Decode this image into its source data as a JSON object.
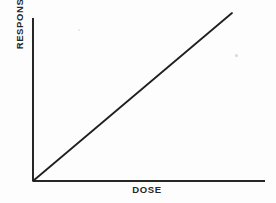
{
  "figure": {
    "background_color": "#fdfdfd",
    "ink_color": "#262626",
    "x_axis_label": "DOSE",
    "y_axis_label": "RESPONSE"
  },
  "chart_data": {
    "type": "line",
    "title": "",
    "subtitle": "",
    "xlabel": "DOSE",
    "ylabel": "RESPONSE",
    "grid": false,
    "legend": false,
    "axis_ticks": false,
    "tick_labels": {
      "x": [],
      "y": []
    },
    "xlim": [
      0,
      1
    ],
    "ylim": [
      0,
      1
    ],
    "series": [
      {
        "name": "dose-response",
        "style": "straight-line",
        "x": [
          0,
          1
        ],
        "y": [
          0,
          1
        ],
        "description": "Linear increasing dose-response relationship through the origin"
      }
    ],
    "annotations": []
  },
  "geometry": {
    "origin_x": 33,
    "origin_y": 181,
    "y_axis_top": 18,
    "x_axis_right": 265,
    "line_end_x": 232,
    "line_end_y": 13,
    "stroke_width": 2
  }
}
